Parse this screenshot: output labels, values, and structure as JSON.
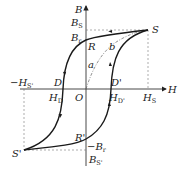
{
  "diagram": {
    "type": "hysteresis-loop",
    "axes": {
      "x_label": "H",
      "y_label": "B"
    },
    "points": {
      "origin": "O",
      "saturation_pos": "S",
      "saturation_neg": "S'",
      "remanence_pos": "R",
      "remanence_neg": "R'",
      "coercive_neg": "D",
      "coercive_pos": "D'"
    },
    "curves": {
      "initial": "a",
      "return": "b"
    },
    "labels": {
      "Bs": "B",
      "Bs_sub": "S",
      "Br": "B",
      "Br_sub": "r",
      "neg_Br": "−B",
      "neg_Br_sub": "r",
      "neg_Bs": "B",
      "neg_Bs_sub": "S'",
      "Hs": "H",
      "Hs_sub": "S",
      "neg_Hs": "−H",
      "neg_Hs_sub": "S'",
      "HD": "H",
      "HD_sub": "D",
      "HDp": "H",
      "HDp_sub": "D'"
    },
    "colors": {
      "curve": "#1a1a1a",
      "axis": "#333333",
      "dashed": "#777777"
    }
  }
}
